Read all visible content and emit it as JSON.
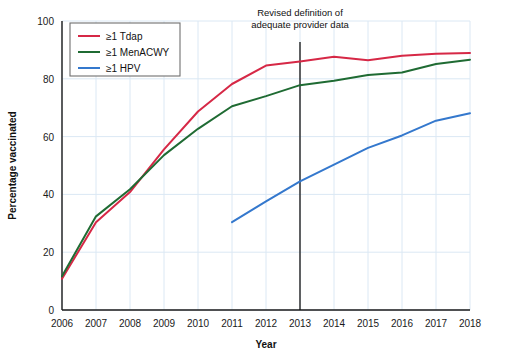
{
  "chart_data": {
    "type": "line",
    "title": "",
    "xlabel": "Year",
    "ylabel": "Percentage vaccinated",
    "x": [
      2006,
      2007,
      2008,
      2009,
      2010,
      2011,
      2012,
      2013,
      2014,
      2015,
      2016,
      2017,
      2018
    ],
    "xtick_labels": [
      "2006",
      "2007",
      "2008",
      "2009",
      "2010",
      "2011",
      "2012",
      "2013",
      "2014",
      "2015",
      "2016",
      "2017",
      "2018"
    ],
    "ytick_labels": [
      "0",
      "20",
      "40",
      "60",
      "80",
      "100"
    ],
    "ytick_values": [
      0,
      20,
      40,
      60,
      80,
      100
    ],
    "ylim": [
      0,
      100
    ],
    "xlim": [
      2006,
      2018
    ],
    "grid": true,
    "legend_position": "top-left",
    "series": [
      {
        "name": "≥1 Tdap",
        "color": "#d62846",
        "x": [
          2006,
          2007,
          2008,
          2009,
          2010,
          2011,
          2012,
          2013,
          2014,
          2015,
          2016,
          2017,
          2018
        ],
        "values": [
          10.8,
          30.4,
          40.8,
          55.6,
          68.7,
          78.2,
          84.6,
          86.0,
          87.6,
          86.4,
          88.0,
          88.7,
          88.9
        ]
      },
      {
        "name": "≥1 MenACWY",
        "color": "#1f6b33",
        "x": [
          2006,
          2007,
          2008,
          2009,
          2010,
          2011,
          2012,
          2013,
          2014,
          2015,
          2016,
          2017,
          2018
        ],
        "values": [
          11.7,
          32.4,
          41.8,
          53.6,
          62.7,
          70.5,
          74.0,
          77.8,
          79.3,
          81.3,
          82.2,
          85.1,
          86.6
        ]
      },
      {
        "name": "≥1 HPV",
        "color": "#3478cd",
        "x": [
          2011,
          2012,
          2013,
          2014,
          2015,
          2016,
          2017,
          2018
        ],
        "values": [
          30.4,
          37.6,
          44.5,
          50.3,
          56.1,
          60.4,
          65.5,
          68.1
        ]
      }
    ],
    "annotations": [
      {
        "name": "revised-definition-note",
        "text_line_1": "Revised definition of",
        "text_line_2": "adequate provider data",
        "at_x": 2013,
        "marker": "vertical-line"
      }
    ]
  }
}
